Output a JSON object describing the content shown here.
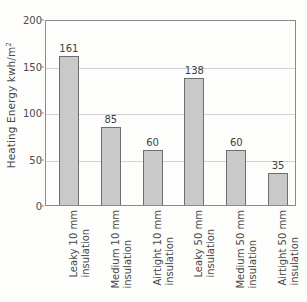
{
  "chart_data": {
    "type": "bar",
    "title": "",
    "xlabel": "",
    "ylabel": "Heating Energy kwh/m2",
    "ylabel_parts": {
      "main": "Heating Energy kwh/m",
      "superscript": "2"
    },
    "ylim": [
      0,
      200
    ],
    "yticks": [
      0,
      50,
      100,
      150,
      200
    ],
    "ytick_labels": [
      "0",
      "50",
      "100",
      "150",
      "200"
    ],
    "grid": "horizontal",
    "legend": "none",
    "categories": [
      "Leaky 10 mm insulation",
      "Medium 10 mm insulation",
      "Airtight 10 mm insulation",
      "Leaky 50 mm insulation",
      "Medium 50 mm insulation",
      "Airtight 50 mm insulation"
    ],
    "category_lines": [
      {
        "line1": "Leaky 10 mm",
        "line2": "insulation"
      },
      {
        "line1": "Medium 10 mm",
        "line2": "insulation"
      },
      {
        "line1": "Airtight 10 mm",
        "line2": "insulation"
      },
      {
        "line1": "Leaky 50 mm",
        "line2": "insulation"
      },
      {
        "line1": "Medium 50 mm",
        "line2": "insulation"
      },
      {
        "line1": "Airtight 50 mm",
        "line2": "insulation"
      }
    ],
    "values": [
      161,
      85,
      60,
      138,
      60,
      35
    ],
    "value_labels": [
      "161",
      "85",
      "60",
      "138",
      "60",
      "35"
    ],
    "bar_color": "#c9c9c9",
    "bar_edge_color": "#6e6e6e",
    "grid_color": "#d2d2d2",
    "axis_color": "#8a8a8a",
    "text_color": "#4a4a4a"
  }
}
